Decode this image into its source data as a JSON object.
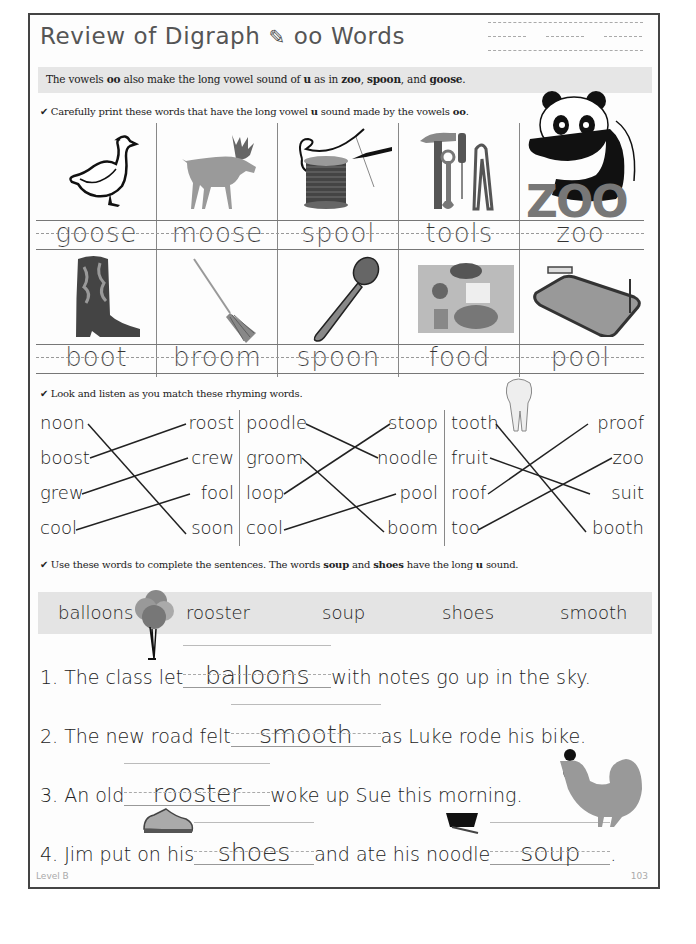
{
  "header": {
    "title_part1": "Review of Digraph",
    "title_icon": "✎",
    "title_part2": "oo Words"
  },
  "banner": {
    "text_a": "The vowels ",
    "bold_oo": "oo",
    "text_b": " also make the long vowel sound of ",
    "bold_u": "u",
    "text_c": " as in ",
    "bold_zoo": "zoo",
    "comma1": ", ",
    "bold_spoon": "spoon",
    "text_d": ", and ",
    "bold_goose": "goose",
    "period": "."
  },
  "section1": {
    "check": "✔",
    "text_a": " Carefully print these words that have the long vowel ",
    "bold_u": "u",
    "text_b": " sound made by the vowels ",
    "bold_oo": "oo",
    "period": ".",
    "row1": [
      {
        "word": "goose",
        "icon": "goose-icon"
      },
      {
        "word": "moose",
        "icon": "moose-icon"
      },
      {
        "word": "spool",
        "icon": "spool-icon"
      },
      {
        "word": "tools",
        "icon": "tools-icon"
      },
      {
        "word": "zoo",
        "icon": "zoo-panda-icon"
      }
    ],
    "row2": [
      {
        "word": "boot",
        "icon": "boot-icon"
      },
      {
        "word": "broom",
        "icon": "broom-icon"
      },
      {
        "word": "spoon",
        "icon": "spoon-icon"
      },
      {
        "word": "food",
        "icon": "food-icon"
      },
      {
        "word": "pool",
        "icon": "pool-icon"
      }
    ],
    "zoo_logo_text": "ZOO"
  },
  "section2": {
    "check": "✔",
    "text": " Look and listen as you match these rhyming words.",
    "groups": [
      {
        "left": [
          "noon",
          "boost",
          "grew",
          "cool"
        ],
        "right": [
          "roost",
          "crew",
          "fool",
          "soon"
        ]
      },
      {
        "left": [
          "poodle",
          "groom",
          "loop",
          "cool"
        ],
        "right": [
          "stoop",
          "noodle",
          "pool",
          "boom"
        ]
      },
      {
        "left": [
          "tooth",
          "fruit",
          "roof",
          "too"
        ],
        "right": [
          "proof",
          "zoo",
          "suit",
          "booth"
        ]
      }
    ]
  },
  "section3": {
    "check": "✔",
    "text_a": " Use these words to complete the sentences. The words ",
    "bold_soup": "soup",
    "text_b": " and ",
    "bold_shoes": "shoes",
    "text_c": " have the long ",
    "bold_u": "u",
    "text_d": " sound.",
    "word_bank": [
      "balloons",
      "rooster",
      "soup",
      "shoes",
      "smooth"
    ],
    "sentences": [
      {
        "pre": "1. The class let",
        "answer": "balloons",
        "post": "with notes go up in the sky."
      },
      {
        "pre": "2. The new road felt",
        "answer": "smooth",
        "post": "as Luke rode his bike."
      },
      {
        "pre": "3. An old",
        "answer": "rooster",
        "post": "woke up Sue this morning."
      },
      {
        "pre": "4. Jim put on his",
        "answer": "shoes",
        "mid": "and ate his noodle",
        "answer2": "soup",
        "post": "."
      }
    ]
  },
  "footer": {
    "level": "Level B",
    "page": "103"
  }
}
